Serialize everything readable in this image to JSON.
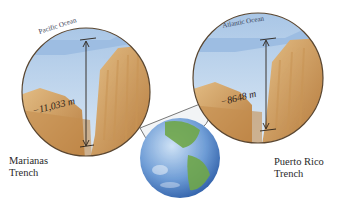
{
  "figure": {
    "left_inset": {
      "ocean_label": "Pacific Ocean",
      "depth_label": "−11,033 m",
      "trench_name_line1": "Marianas",
      "trench_name_line2": "Trench"
    },
    "right_inset": {
      "ocean_label": "Atlantic Ocean",
      "depth_label": "−8648 m",
      "trench_name_line1": "Puerto Rico",
      "trench_name_line2": "Trench"
    },
    "colors": {
      "water_light": "#cfe1f2",
      "water_dark": "#9fbfe0",
      "rock_light": "#dcb27a",
      "rock_dark": "#b77c3d",
      "circle_outline": "#5a4630",
      "globe_ocean": "#6d9bd4",
      "globe_land": "#6fa74a"
    }
  }
}
